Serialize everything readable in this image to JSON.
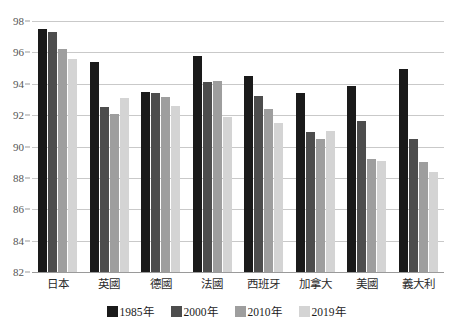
{
  "chart_data": {
    "type": "bar",
    "title": "",
    "subtitle": "",
    "xlabel": "",
    "ylabel": "",
    "ylim": [
      82,
      98
    ],
    "ytick_step": 2,
    "yticks": [
      98,
      96,
      94,
      92,
      90,
      88,
      86,
      84,
      82
    ],
    "grid": true,
    "legend_position": "bottom",
    "categories": [
      "日本",
      "英國",
      "德國",
      "法國",
      "西班牙",
      "加拿大",
      "美國",
      "義大利"
    ],
    "series": [
      {
        "name": "1985年",
        "color": "#1a1a1a",
        "values": [
          97.5,
          95.4,
          93.5,
          95.8,
          94.5,
          93.4,
          93.85,
          94.95
        ]
      },
      {
        "name": "2000年",
        "color": "#4d4d4d",
        "values": [
          97.3,
          92.5,
          93.4,
          94.1,
          93.2,
          90.95,
          91.6,
          90.5
        ]
      },
      {
        "name": "2010年",
        "color": "#9e9e9e",
        "values": [
          96.2,
          92.05,
          93.15,
          94.15,
          92.4,
          90.45,
          89.2,
          89.0
        ]
      },
      {
        "name": "2019年",
        "color": "#d4d4d4",
        "values": [
          95.6,
          93.1,
          92.6,
          91.85,
          91.5,
          91.0,
          89.1,
          88.35
        ]
      }
    ]
  },
  "colors": {
    "gridline": "#c9c9c9",
    "axis": "#9a9a9a",
    "tick_text": "#555555",
    "label_text": "#2b2b2b",
    "background": "#ffffff"
  }
}
